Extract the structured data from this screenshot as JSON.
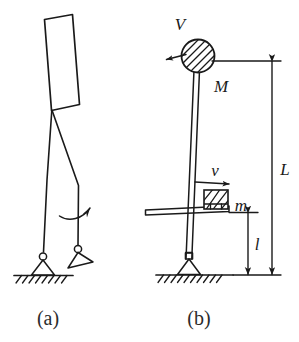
{
  "figure": {
    "background_color": "#ffffff",
    "ink_color": "#1a1a1a",
    "caption_color": "#2b2b2b",
    "panels": [
      {
        "id": "a",
        "caption": "(a)",
        "description": "Stick-figure human with rectangular torso, two legs, pin joints at feet on hatched ground, and a curved rotation arrow at the rear leg",
        "elements": {
          "torso_name": "torso-rectangle",
          "leg_front_name": "front-leg",
          "leg_rear_name": "rear-leg",
          "pivot_ground_name": "ground-pivot-joint",
          "pivot_raised_name": "raised-foot-joint",
          "rotation_arrow_name": "rotation-arrow",
          "ground_name": "hatched-ground"
        }
      },
      {
        "id": "b",
        "caption": "(b)",
        "description": "Mechanical abstraction: a rod pinned to the ground carrying a hatched circular mass M at the top with velocity V to the left, and a hatched block m sliding right with velocity v on a horizontal platform at height l; total rod length L",
        "labels": {
          "velocity_top": "V",
          "mass_top": "M",
          "velocity_block": "v",
          "mass_block": "m",
          "length_total": "L",
          "length_platform": "l"
        },
        "elements": {
          "rod_name": "pendulum-rod",
          "mass_circle_name": "top-mass-M",
          "block_name": "slider-block-m",
          "platform_name": "horizontal-platform",
          "pivot_name": "ground-pivot-joint",
          "ground_name": "hatched-ground",
          "dim_L_name": "dimension-L",
          "dim_l_name": "dimension-l"
        }
      }
    ]
  },
  "captions": {
    "a": "(a)",
    "b": "(b)"
  },
  "symbols": {
    "V": "V",
    "M": "M",
    "v": "v",
    "m": "m",
    "L": "L",
    "l": "l"
  }
}
